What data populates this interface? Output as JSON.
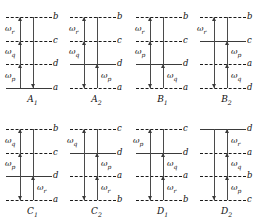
{
  "figure": {
    "level_color": "#1a1a1a",
    "solid_level_color": "#3a3a3a",
    "line_color": "#4a4a4a",
    "background": "#ffffff"
  },
  "panels": [
    {
      "id": "A1",
      "caption": "A",
      "caption_sub": "1",
      "levels": [
        {
          "label": "b",
          "style": "dashed",
          "y": 17
        },
        {
          "label": "c",
          "style": "dashed",
          "y": 41
        },
        {
          "label": "d",
          "style": "dashed",
          "y": 64
        },
        {
          "label": "a",
          "style": "solid",
          "y": 88
        }
      ],
      "omegas": [
        {
          "text": "ω",
          "sub": "r",
          "x": 5,
          "y": 29
        },
        {
          "text": "ω",
          "sub": "q",
          "x": 5,
          "y": 52
        },
        {
          "text": "ω",
          "sub": "p",
          "x": 5,
          "y": 76
        }
      ],
      "vlines": [
        {
          "side": "left",
          "top": 17,
          "bottom": 88
        },
        {
          "side": "right",
          "top": 17,
          "bottom": 88
        }
      ],
      "arrows": [
        {
          "side": "left",
          "dir": "up",
          "y": 17
        },
        {
          "side": "left",
          "dir": "up",
          "y": 41
        },
        {
          "side": "left",
          "dir": "up",
          "y": 64
        },
        {
          "side": "right",
          "dir": "down",
          "y": 88
        }
      ]
    },
    {
      "id": "A2",
      "caption": "A",
      "caption_sub": "2",
      "levels": [
        {
          "label": "b",
          "style": "dashed",
          "y": 17
        },
        {
          "label": "c",
          "style": "dashed",
          "y": 41
        },
        {
          "label": "d",
          "style": "solid",
          "y": 64
        },
        {
          "label": "a",
          "style": "dashed",
          "y": 88
        }
      ],
      "omegas": [
        {
          "text": "ω",
          "sub": "r",
          "x": 5,
          "y": 29
        },
        {
          "text": "ω",
          "sub": "q",
          "x": 5,
          "y": 52
        },
        {
          "text": "ω",
          "sub": "p",
          "x": 37,
          "y": 76
        }
      ],
      "vlines": [
        {
          "side": "left",
          "top": 17,
          "bottom": 88
        },
        {
          "side": "right",
          "top": 17,
          "bottom": 88
        }
      ],
      "arrows": [
        {
          "side": "left",
          "dir": "up",
          "y": 17
        },
        {
          "side": "left",
          "dir": "up",
          "y": 41
        },
        {
          "side": "left",
          "dir": "down",
          "y": 88
        },
        {
          "side": "right",
          "dir": "up",
          "y": 64
        }
      ]
    },
    {
      "id": "B1",
      "caption": "B",
      "caption_sub": "1",
      "levels": [
        {
          "label": "b",
          "style": "dashed",
          "y": 17
        },
        {
          "label": "c",
          "style": "dashed",
          "y": 41
        },
        {
          "label": "d",
          "style": "solid",
          "y": 64
        },
        {
          "label": "a",
          "style": "dashed",
          "y": 88
        }
      ],
      "omegas": [
        {
          "text": "ω",
          "sub": "r",
          "x": 5,
          "y": 29
        },
        {
          "text": "ω",
          "sub": "p",
          "x": 5,
          "y": 52
        },
        {
          "text": "ω",
          "sub": "q",
          "x": 37,
          "y": 76
        }
      ],
      "vlines": [
        {
          "side": "left",
          "top": 17,
          "bottom": 88
        },
        {
          "side": "right",
          "top": 17,
          "bottom": 88
        }
      ],
      "arrows": [
        {
          "side": "left",
          "dir": "up",
          "y": 17
        },
        {
          "side": "left",
          "dir": "up",
          "y": 41
        },
        {
          "side": "left",
          "dir": "down",
          "y": 88
        },
        {
          "side": "right",
          "dir": "up",
          "y": 64
        }
      ]
    },
    {
      "id": "B2",
      "caption": "B",
      "caption_sub": "2",
      "levels": [
        {
          "label": "b",
          "style": "dashed",
          "y": 17
        },
        {
          "label": "c",
          "style": "solid",
          "y": 41
        },
        {
          "label": "a",
          "style": "dashed",
          "y": 64
        },
        {
          "label": "d",
          "style": "dashed",
          "y": 88
        }
      ],
      "omegas": [
        {
          "text": "ω",
          "sub": "r",
          "x": 3,
          "y": 29
        },
        {
          "text": "ω",
          "sub": "p",
          "x": 37,
          "y": 52
        },
        {
          "text": "ω",
          "sub": "q",
          "x": 37,
          "y": 76
        }
      ],
      "vlines": [
        {
          "side": "left",
          "top": 17,
          "bottom": 88
        },
        {
          "side": "right",
          "top": 17,
          "bottom": 88
        }
      ],
      "arrows": [
        {
          "side": "left",
          "dir": "up",
          "y": 17
        },
        {
          "side": "left",
          "dir": "down",
          "y": 88
        },
        {
          "side": "right",
          "dir": "up",
          "y": 41
        },
        {
          "side": "right",
          "dir": "up",
          "y": 64
        }
      ]
    },
    {
      "id": "C1",
      "caption": "C",
      "caption_sub": "1",
      "levels": [
        {
          "label": "b",
          "style": "dashed",
          "y": 17
        },
        {
          "label": "c",
          "style": "dashed",
          "y": 41
        },
        {
          "label": "d",
          "style": "solid",
          "y": 64
        },
        {
          "label": "a",
          "style": "dashed",
          "y": 88
        }
      ],
      "omegas": [
        {
          "text": "ω",
          "sub": "q",
          "x": 5,
          "y": 29
        },
        {
          "text": "ω",
          "sub": "p",
          "x": 5,
          "y": 52
        },
        {
          "text": "ω",
          "sub": "r",
          "x": 37,
          "y": 76
        }
      ],
      "vlines": [
        {
          "side": "left",
          "top": 17,
          "bottom": 88
        },
        {
          "side": "right",
          "top": 17,
          "bottom": 88
        }
      ],
      "arrows": [
        {
          "side": "left",
          "dir": "up",
          "y": 17
        },
        {
          "side": "left",
          "dir": "up",
          "y": 41
        },
        {
          "side": "left",
          "dir": "down",
          "y": 88
        },
        {
          "side": "right",
          "dir": "up",
          "y": 64
        }
      ]
    },
    {
      "id": "C2",
      "caption": "C",
      "caption_sub": "2",
      "levels": [
        {
          "label": "c",
          "style": "dashed",
          "y": 17
        },
        {
          "label": "d",
          "style": "solid",
          "y": 41
        },
        {
          "label": "a",
          "style": "dashed",
          "y": 64
        },
        {
          "label": "b",
          "style": "dashed",
          "y": 88
        }
      ],
      "omegas": [
        {
          "text": "ω",
          "sub": "q",
          "x": 3,
          "y": 29
        },
        {
          "text": "ω",
          "sub": "p",
          "x": 37,
          "y": 52
        },
        {
          "text": "ω",
          "sub": "r",
          "x": 37,
          "y": 76
        }
      ],
      "vlines": [
        {
          "side": "left",
          "top": 17,
          "bottom": 88
        },
        {
          "side": "right",
          "top": 17,
          "bottom": 88
        }
      ],
      "arrows": [
        {
          "side": "left",
          "dir": "up",
          "y": 17
        },
        {
          "side": "left",
          "dir": "down",
          "y": 88
        },
        {
          "side": "right",
          "dir": "up",
          "y": 41
        },
        {
          "side": "right",
          "dir": "up",
          "y": 64
        }
      ]
    },
    {
      "id": "D1",
      "caption": "D",
      "caption_sub": "1",
      "levels": [
        {
          "label": "c",
          "style": "dashed",
          "y": 17
        },
        {
          "label": "d",
          "style": "solid",
          "y": 41
        },
        {
          "label": "a",
          "style": "dashed",
          "y": 64
        },
        {
          "label": "b",
          "style": "dashed",
          "y": 88
        }
      ],
      "omegas": [
        {
          "text": "ω",
          "sub": "p",
          "x": 3,
          "y": 29
        },
        {
          "text": "ω",
          "sub": "q",
          "x": 37,
          "y": 52
        },
        {
          "text": "ω",
          "sub": "r",
          "x": 37,
          "y": 76
        }
      ],
      "vlines": [
        {
          "side": "left",
          "top": 17,
          "bottom": 88
        },
        {
          "side": "right",
          "top": 17,
          "bottom": 88
        }
      ],
      "arrows": [
        {
          "side": "left",
          "dir": "up",
          "y": 17
        },
        {
          "side": "left",
          "dir": "down",
          "y": 88
        },
        {
          "side": "right",
          "dir": "up",
          "y": 41
        },
        {
          "side": "right",
          "dir": "up",
          "y": 64
        }
      ]
    },
    {
      "id": "D2",
      "caption": "D",
      "caption_sub": "2",
      "levels": [
        {
          "label": "d",
          "style": "solid",
          "y": 17
        },
        {
          "label": "a",
          "style": "dashed",
          "y": 41
        },
        {
          "label": "b",
          "style": "dashed",
          "y": 64
        },
        {
          "label": "c",
          "style": "dashed",
          "y": 88
        }
      ],
      "omegas": [
        {
          "text": "ω",
          "sub": "r",
          "x": 37,
          "y": 29
        },
        {
          "text": "ω",
          "sub": "q",
          "x": 37,
          "y": 52
        },
        {
          "text": "ω",
          "sub": "p",
          "x": 37,
          "y": 76
        }
      ],
      "vlines": [
        {
          "side": "left",
          "top": 17,
          "bottom": 88
        },
        {
          "side": "right",
          "top": 17,
          "bottom": 88
        }
      ],
      "arrows": [
        {
          "side": "left",
          "dir": "down",
          "y": 88
        },
        {
          "side": "right",
          "dir": "up",
          "y": 17
        },
        {
          "side": "right",
          "dir": "up",
          "y": 41
        },
        {
          "side": "right",
          "dir": "up",
          "y": 64
        }
      ]
    }
  ]
}
